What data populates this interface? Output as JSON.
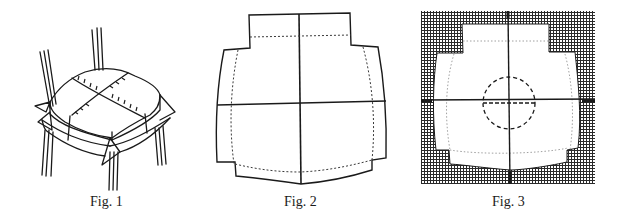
{
  "figures": [
    {
      "id": "fig1",
      "caption": "Fig. 1",
      "description": "Chair seat with cushion cover pinned along seam lines, corners folded around chair legs"
    },
    {
      "id": "fig2",
      "caption": "Fig. 2",
      "description": "Flat cushion cover pattern with center cross lines and dotted seam allowance"
    },
    {
      "id": "fig3",
      "caption": "Fig. 3",
      "description": "Pattern placed on grid paper with center cross, dotted seam line and dashed circle"
    }
  ],
  "colors": {
    "ink": "#1a1a1a",
    "background": "#ffffff",
    "grid": "#2a2a2a"
  }
}
